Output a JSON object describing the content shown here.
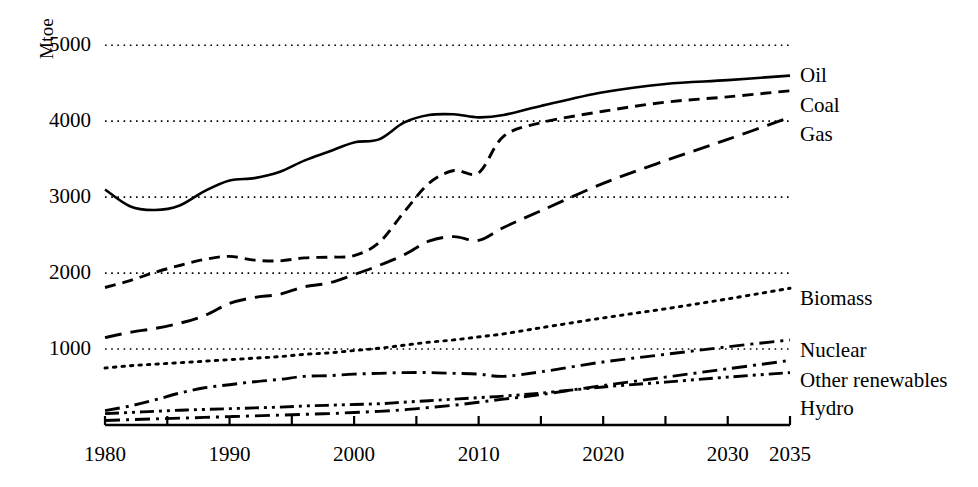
{
  "axis": {
    "y_unit_label": "Mtoe",
    "y_ticks": [
      "5000",
      "4000",
      "3000",
      "2000",
      "1000"
    ],
    "x_ticks": [
      "1980",
      "1990",
      "2000",
      "2010",
      "2020",
      "2030",
      "2035"
    ]
  },
  "legend": {
    "items": [
      {
        "label": "Oil"
      },
      {
        "label": "Coal"
      },
      {
        "label": "Gas"
      },
      {
        "label": "Biomass"
      },
      {
        "label": "Nuclear"
      },
      {
        "label": "Other renewables"
      },
      {
        "label": "Hydro"
      }
    ]
  },
  "chart_data": {
    "type": "line",
    "title": "",
    "xlabel": "",
    "ylabel": "Mtoe",
    "xlim": [
      1980,
      2035
    ],
    "ylim": [
      0,
      5200
    ],
    "grid": "horizontal-dotted",
    "y_gridlines": [
      1000,
      2000,
      3000,
      4000,
      5000
    ],
    "x_tick_values": [
      1980,
      1985,
      1990,
      1995,
      2000,
      2005,
      2010,
      2015,
      2020,
      2025,
      2030,
      2035
    ],
    "x_labeled_values": [
      1980,
      1990,
      2000,
      2010,
      2020,
      2030,
      2035
    ],
    "legend_position": "right-inline",
    "colors": {
      "line": "#000000",
      "grid": "#000000",
      "axis": "#000000"
    },
    "x": [
      1980,
      1982,
      1984,
      1986,
      1988,
      1990,
      1992,
      1994,
      1996,
      1998,
      2000,
      2002,
      2004,
      2006,
      2008,
      2010,
      2012,
      2015,
      2020,
      2025,
      2030,
      2035
    ],
    "series": [
      {
        "name": "Oil",
        "dash": "solid",
        "values": [
          3100,
          2880,
          2830,
          2890,
          3080,
          3220,
          3250,
          3330,
          3480,
          3600,
          3720,
          3760,
          3980,
          4080,
          4090,
          4050,
          4080,
          4200,
          4380,
          4490,
          4540,
          4600
        ]
      },
      {
        "name": "Coal",
        "dash": "medium-dash",
        "values": [
          1810,
          1900,
          2010,
          2100,
          2180,
          2220,
          2170,
          2160,
          2200,
          2210,
          2230,
          2400,
          2800,
          3180,
          3350,
          3320,
          3800,
          3980,
          4130,
          4250,
          4320,
          4400
        ]
      },
      {
        "name": "Gas",
        "dash": "long-dash",
        "values": [
          1150,
          1220,
          1270,
          1340,
          1440,
          1600,
          1680,
          1720,
          1820,
          1870,
          1980,
          2100,
          2240,
          2420,
          2480,
          2430,
          2600,
          2820,
          3180,
          3480,
          3760,
          4050
        ]
      },
      {
        "name": "Biomass",
        "dash": "dotted",
        "values": [
          750,
          780,
          800,
          820,
          840,
          860,
          880,
          900,
          930,
          950,
          980,
          1010,
          1050,
          1090,
          1120,
          1160,
          1200,
          1280,
          1410,
          1530,
          1660,
          1800
        ]
      },
      {
        "name": "Nuclear",
        "dash": "dash-dot",
        "values": [
          190,
          250,
          330,
          420,
          490,
          530,
          570,
          600,
          640,
          650,
          670,
          680,
          690,
          690,
          680,
          670,
          640,
          700,
          830,
          930,
          1030,
          1120
        ]
      },
      {
        "name": "Other renewables",
        "dash": "dash-dot",
        "values": [
          60,
          70,
          80,
          90,
          100,
          110,
          120,
          130,
          140,
          150,
          165,
          180,
          200,
          230,
          260,
          300,
          340,
          400,
          520,
          630,
          740,
          850
        ]
      },
      {
        "name": "Hydro",
        "dash": "dash-dot-dot",
        "values": [
          150,
          165,
          180,
          195,
          205,
          215,
          225,
          235,
          250,
          260,
          270,
          280,
          300,
          320,
          340,
          360,
          380,
          420,
          500,
          565,
          630,
          690
        ]
      }
    ]
  }
}
